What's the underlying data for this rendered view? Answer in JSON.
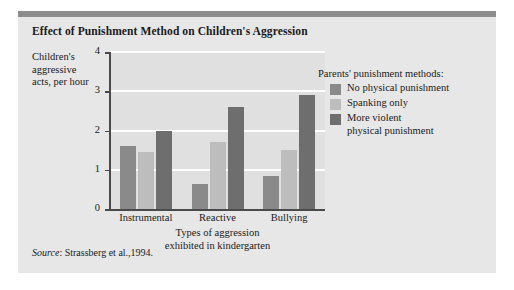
{
  "figure": {
    "title": "Effect of Punishment Method on Children's Aggression",
    "source_label": "Source",
    "source_text": ": Strassberg et al.,1994."
  },
  "legend": {
    "title": "Parents' punishment methods:",
    "entries": [
      {
        "label": "No physical punishment",
        "color": "#8a8a8a"
      },
      {
        "label": "Spanking only",
        "color": "#bdbdbd"
      },
      {
        "label": "More violent\nphysical punishment",
        "color": "#6e6e6e"
      }
    ]
  },
  "chart_data": {
    "type": "bar",
    "title": "Effect of Punishment Method on Children's Aggression",
    "xlabel": "Types of aggression exhibited in kindergarten",
    "ylabel": "Children's aggressive acts, per hour",
    "categories": [
      "Instrumental",
      "Reactive",
      "Bullying"
    ],
    "series": [
      {
        "name": "No physical punishment",
        "color": "#8a8a8a",
        "values": [
          1.6,
          0.65,
          0.85
        ]
      },
      {
        "name": "Spanking only",
        "color": "#bdbdbd",
        "values": [
          1.45,
          1.7,
          1.5
        ]
      },
      {
        "name": "More violent physical punishment",
        "color": "#6e6e6e",
        "values": [
          2.0,
          2.6,
          2.9
        ]
      }
    ],
    "ylim": [
      0,
      4
    ],
    "yticks": [
      0,
      1,
      2,
      3,
      4
    ],
    "ytick_labels": [
      "0",
      "1",
      "2",
      "3",
      "4"
    ],
    "grid": true,
    "legend_position": "right"
  }
}
